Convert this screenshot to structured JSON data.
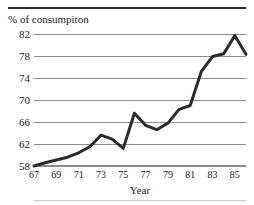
{
  "figure": {
    "top_rule_ghost_text": "",
    "axis_title_top": "% of consumpiton",
    "xlabel": "Year"
  },
  "colors": {
    "line": "#2b2b2b",
    "grid": "#8c8c8c",
    "text": "#1a1a1a",
    "background": "#ffffff"
  },
  "chart_data": {
    "type": "line",
    "title": "",
    "subtitle": "",
    "xlabel": "Year",
    "ylabel": "% of consumpiton",
    "xlim": [
      67,
      86
    ],
    "ylim": [
      58,
      82
    ],
    "grid": true,
    "legend": false,
    "ytick_labels": [
      "82",
      "78",
      "74",
      "70",
      "66",
      "62",
      "58"
    ],
    "ytick_values": [
      82,
      78,
      74,
      70,
      66,
      62,
      58
    ],
    "xtick_labels": [
      "67",
      "69",
      "71",
      "73",
      "75",
      "77",
      "79",
      "81",
      "83",
      "85"
    ],
    "xtick_values": [
      67,
      69,
      71,
      73,
      75,
      77,
      79,
      81,
      83,
      85
    ],
    "series": [
      {
        "name": "% of consumpiton",
        "x": [
          67,
          68,
          69,
          70,
          71,
          72,
          73,
          74,
          75,
          76,
          77,
          78,
          79,
          80,
          81,
          82,
          83,
          84,
          85,
          86
        ],
        "values": [
          58.0,
          58.6,
          59.1,
          59.6,
          60.4,
          61.5,
          63.6,
          62.9,
          61.2,
          67.6,
          65.4,
          64.6,
          65.8,
          68.3,
          69.0,
          75.2,
          77.9,
          78.4,
          81.7,
          78.3
        ]
      }
    ]
  }
}
